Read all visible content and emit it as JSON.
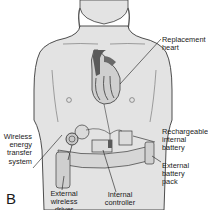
{
  "figure": {
    "panel_letter": "B",
    "colors": {
      "skin": "#e3e3e3",
      "outline": "#3a3a3a",
      "heart_dark": "#5a5a5a",
      "heart_light": "#cfcfcf",
      "belt": "#d6d6d6"
    },
    "labels": {
      "replacement_heart": "Replacement\nheart",
      "wireless_energy_transfer_system": "Wireless\nenergy\ntransfer\nsystem",
      "rechargeable_internal_battery": "Rechargeable\ninternal\nbattery",
      "external_battery_pack": "External\nbattery\npack",
      "external_wireless_driver": "External\nwireless\ndriver",
      "internal_controller": "Internal\ncontroller"
    }
  }
}
